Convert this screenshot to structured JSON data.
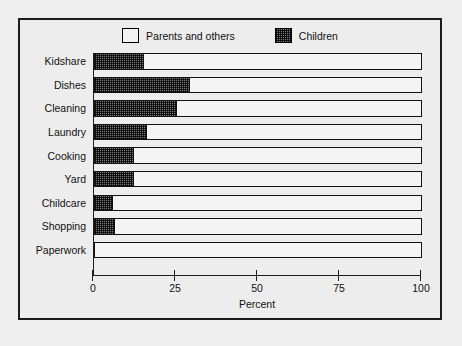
{
  "chart_data": {
    "type": "bar",
    "orientation": "horizontal",
    "stacked": true,
    "title": "",
    "xlabel": "Percent",
    "ylabel": "",
    "xlim": [
      0,
      100
    ],
    "xticks": [
      0,
      25,
      50,
      75,
      100
    ],
    "xtick_labels": [
      "0",
      "25",
      "50",
      "75",
      "100"
    ],
    "grid": false,
    "legend_position": "top-center",
    "categories": [
      "Kidshare",
      "Dishes",
      "Cleaning",
      "Laundry",
      "Cooking",
      "Yard",
      "Childcare",
      "Shopping",
      "Paperwork"
    ],
    "series": [
      {
        "name": "Children",
        "fill": "hatched-checker",
        "values": [
          15,
          29,
          25,
          16,
          12,
          12,
          5.5,
          6,
          0
        ]
      },
      {
        "name": "Parents and others",
        "fill": "white",
        "values": [
          85,
          71,
          75,
          84,
          88,
          88,
          94.5,
          94,
          100
        ]
      }
    ]
  },
  "legend": {
    "items": [
      {
        "label": "Parents and others",
        "swatch": "white-square"
      },
      {
        "label": "Children",
        "swatch": "hatched-square"
      }
    ]
  },
  "axis": {
    "x_title": "Percent",
    "ticks": [
      "0",
      "25",
      "50",
      "75",
      "100"
    ]
  },
  "colors": {
    "background": "#ededed",
    "frame": "#1c1c1c",
    "bar_outline": "#111111",
    "parents_fill": "#f4f4f4",
    "children_fill": "#7a7a7a"
  }
}
